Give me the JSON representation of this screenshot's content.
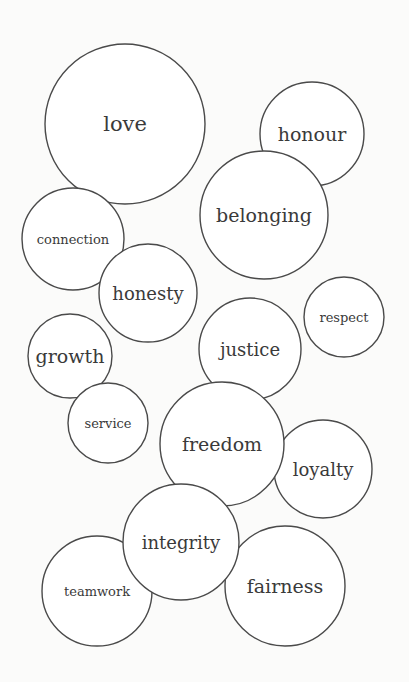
{
  "diagram": {
    "type": "bubble-cloud",
    "background": "#fbfbfa",
    "stroke_color": "#4a4a4a",
    "text_color": "#3a3a3a",
    "bubbles": [
      {
        "label": "love",
        "cx": 125,
        "cy": 124,
        "r": 80,
        "font_size": 21
      },
      {
        "label": "honour",
        "cx": 312,
        "cy": 134,
        "r": 52,
        "font_size": 19
      },
      {
        "label": "belonging",
        "cx": 264,
        "cy": 215,
        "r": 64,
        "font_size": 19
      },
      {
        "label": "connection",
        "cx": 73,
        "cy": 239,
        "r": 51,
        "font_size": 13
      },
      {
        "label": "honesty",
        "cx": 148,
        "cy": 293,
        "r": 49,
        "font_size": 18
      },
      {
        "label": "respect",
        "cx": 344,
        "cy": 317,
        "r": 40,
        "font_size": 13
      },
      {
        "label": "justice",
        "cx": 250,
        "cy": 349,
        "r": 51,
        "font_size": 18
      },
      {
        "label": "growth",
        "cx": 70,
        "cy": 356,
        "r": 42,
        "font_size": 19
      },
      {
        "label": "service",
        "cx": 108,
        "cy": 423,
        "r": 40,
        "font_size": 13
      },
      {
        "label": "loyalty",
        "cx": 323,
        "cy": 469,
        "r": 49,
        "font_size": 18
      },
      {
        "label": "freedom",
        "cx": 222,
        "cy": 444,
        "r": 62,
        "font_size": 19
      },
      {
        "label": "teamwork",
        "cx": 97,
        "cy": 591,
        "r": 55,
        "font_size": 13
      },
      {
        "label": "fairness",
        "cx": 285,
        "cy": 586,
        "r": 60,
        "font_size": 19
      },
      {
        "label": "integrity",
        "cx": 181,
        "cy": 542,
        "r": 58,
        "font_size": 18
      }
    ]
  }
}
